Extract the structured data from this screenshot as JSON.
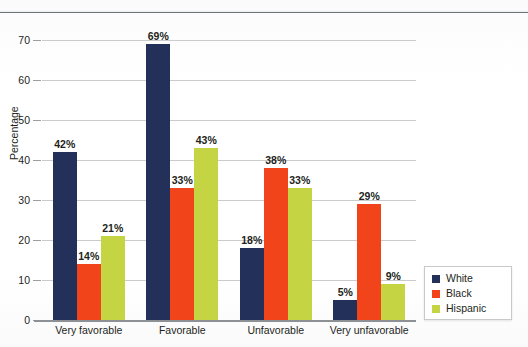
{
  "chart_data": {
    "type": "bar",
    "title": "",
    "xlabel": "",
    "ylabel": "Percentage",
    "ylim": [
      0,
      70
    ],
    "yticks": [
      "0",
      "10",
      "20",
      "30",
      "40",
      "50",
      "60",
      "70"
    ],
    "grid": true,
    "legend_position": "bottom-right",
    "categories": [
      "Very favorable",
      "Favorable",
      "Unfavorable",
      "Very unfavorable"
    ],
    "series": [
      {
        "name": "White",
        "color": "#22305a",
        "values": [
          42,
          69,
          18,
          5
        ],
        "labels": [
          "42%",
          "69%",
          "18%",
          "5%"
        ]
      },
      {
        "name": "Black",
        "color": "#f2441a",
        "values": [
          14,
          33,
          38,
          29
        ],
        "labels": [
          "14%",
          "33%",
          "38%",
          "29%"
        ]
      },
      {
        "name": "Hispanic",
        "color": "#c4d442",
        "values": [
          21,
          43,
          33,
          9
        ],
        "labels": [
          "21%",
          "43%",
          "33%",
          "9%"
        ]
      }
    ]
  },
  "legend": {
    "items": [
      {
        "label": "White"
      },
      {
        "label": "Black"
      },
      {
        "label": "Hispanic"
      }
    ]
  }
}
